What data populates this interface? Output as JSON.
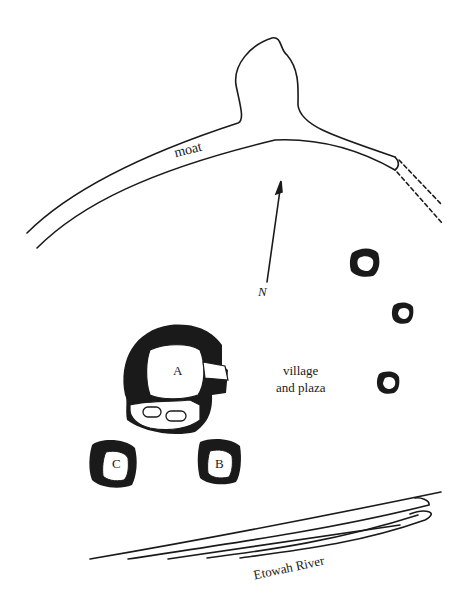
{
  "map": {
    "labels": {
      "moat": "moat",
      "north": "N",
      "village_line1": "village",
      "village_line2": "and plaza",
      "river": "Etowah River"
    },
    "mounds": [
      {
        "id": "A",
        "label": "A"
      },
      {
        "id": "B",
        "label": "B"
      },
      {
        "id": "C",
        "label": "C"
      }
    ],
    "colors": {
      "ink": "#1a1a1a",
      "paper": "#ffffff"
    }
  }
}
